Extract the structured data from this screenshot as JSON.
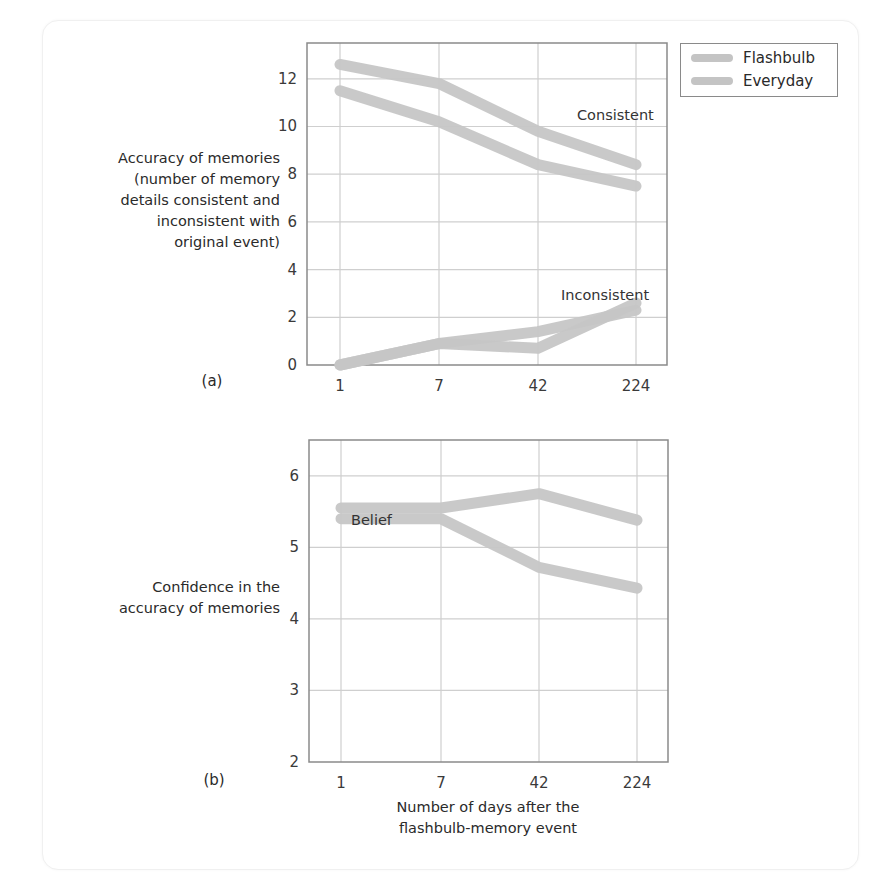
{
  "legend": {
    "items": [
      {
        "label": "Flashbulb",
        "color": "#c4c4c4"
      },
      {
        "label": "Everyday",
        "color": "#c4c4c4"
      }
    ]
  },
  "chart_data": [
    {
      "type": "line",
      "panel_label": "(a)",
      "title": "",
      "xlabel": "",
      "ylabel": "Accuracy of memories (number of memory details consistent and inconsistent with original event)",
      "ylabel_lines": [
        "Accuracy of memories",
        "(number of memory",
        "details consistent and",
        "inconsistent with",
        "original event)"
      ],
      "categories": [
        "1",
        "7",
        "42",
        "224"
      ],
      "yticks": [
        0,
        2,
        4,
        6,
        8,
        10,
        12
      ],
      "ylim": [
        0,
        13.5
      ],
      "grid": true,
      "legend_position": "top-right",
      "annotations": [
        {
          "text": "Consistent"
        },
        {
          "text": "Inconsistent"
        }
      ],
      "series": [
        {
          "name": "Flashbulb - Consistent",
          "values": [
            12.6,
            11.8,
            9.8,
            8.4
          ]
        },
        {
          "name": "Everyday - Consistent",
          "values": [
            11.5,
            10.2,
            8.4,
            7.5
          ]
        },
        {
          "name": "Flashbulb - Inconsistent",
          "values": [
            0.0,
            0.9,
            1.4,
            2.3
          ]
        },
        {
          "name": "Everyday - Inconsistent",
          "values": [
            0.0,
            0.9,
            0.7,
            2.6
          ]
        }
      ]
    },
    {
      "type": "line",
      "panel_label": "(b)",
      "title": "",
      "xlabel": "Number of days after the flashbulb-memory event",
      "xlabel_lines": [
        "Number of days after the",
        "flashbulb-memory event"
      ],
      "ylabel": "Confidence in the accuracy of memories",
      "ylabel_lines": [
        "Confidence in the",
        "accuracy of memories"
      ],
      "categories": [
        "1",
        "7",
        "42",
        "224"
      ],
      "yticks": [
        2,
        3,
        4,
        5,
        6
      ],
      "ylim": [
        2,
        6.5
      ],
      "grid": true,
      "annotations": [
        {
          "text": "Belief"
        }
      ],
      "series": [
        {
          "name": "Flashbulb - Belief",
          "values": [
            5.55,
            5.55,
            5.75,
            5.38
          ]
        },
        {
          "name": "Everyday - Belief",
          "values": [
            5.4,
            5.4,
            4.72,
            4.43
          ]
        }
      ]
    }
  ]
}
